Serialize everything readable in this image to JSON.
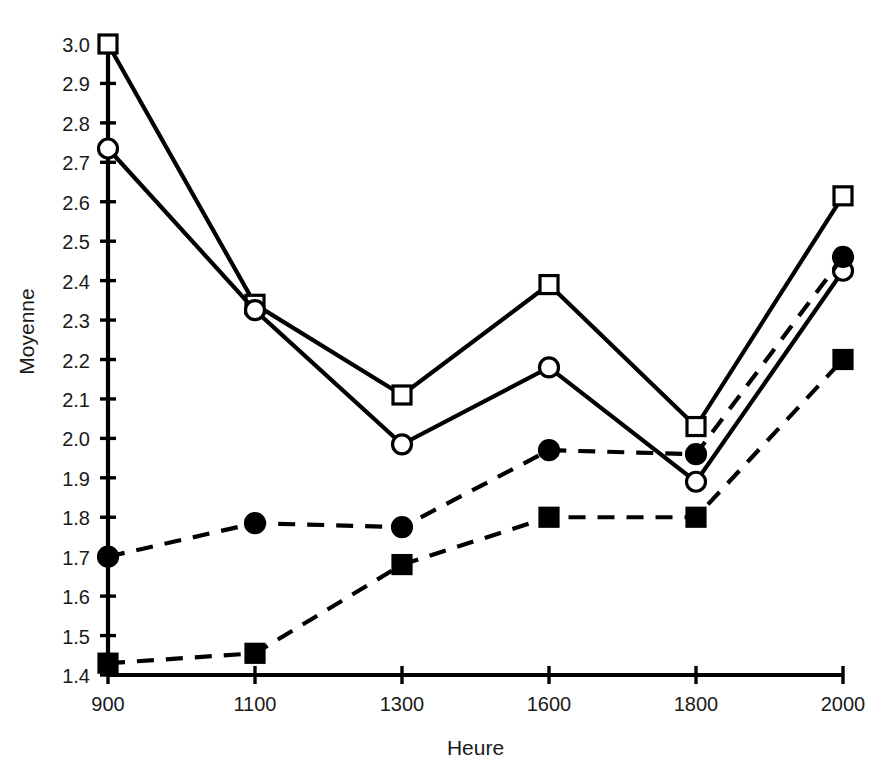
{
  "chart_data": {
    "type": "line",
    "title": "",
    "xlabel": "Heure",
    "ylabel": "Moyenne",
    "x": [
      900,
      1100,
      1300,
      1600,
      1800,
      2000
    ],
    "categories": [
      "900",
      "1100",
      "1300",
      "1600",
      "1800",
      "2000"
    ],
    "xtick_labels": [
      "900",
      "1100",
      "1300",
      "1600",
      "1800",
      "2000"
    ],
    "ytick_labels": [
      "1.4",
      "1.5",
      "1.6",
      "1.7",
      "1.8",
      "1.9",
      "2.0",
      "2.1",
      "2.2",
      "2.3",
      "2.4",
      "2.5",
      "2.6",
      "2.7",
      "2.8",
      "2.9",
      "3.0"
    ],
    "ylim": [
      1.4,
      3.0
    ],
    "ytick_step": 0.1,
    "grid": false,
    "legend": "none",
    "series": [
      {
        "name": "open-square",
        "marker": "open-square",
        "linestyle": "solid",
        "color": "#000000",
        "values": [
          3.0,
          2.34,
          2.11,
          2.39,
          2.03,
          2.615
        ]
      },
      {
        "name": "open-circle",
        "marker": "open-circle",
        "linestyle": "solid",
        "color": "#000000",
        "values": [
          2.735,
          2.325,
          1.985,
          2.18,
          1.89,
          2.425
        ]
      },
      {
        "name": "filled-circle",
        "marker": "filled-circle",
        "linestyle": "dashed",
        "color": "#000000",
        "values": [
          1.7,
          1.785,
          1.775,
          1.97,
          1.96,
          2.46
        ]
      },
      {
        "name": "filled-square",
        "marker": "filled-square",
        "linestyle": "dashed",
        "color": "#000000",
        "values": [
          1.43,
          1.455,
          1.68,
          1.8,
          1.8,
          2.2
        ]
      }
    ]
  }
}
